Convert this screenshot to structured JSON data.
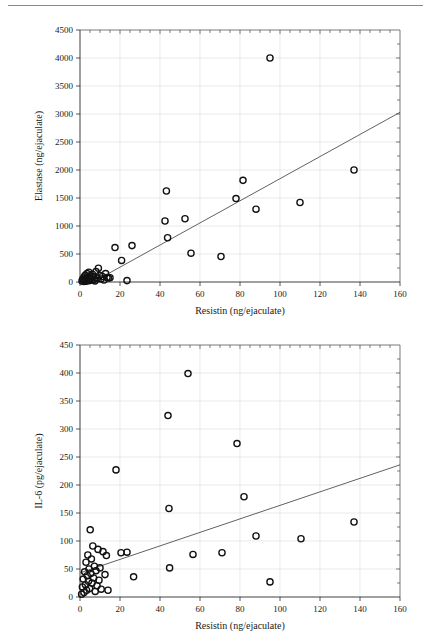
{
  "figure": {
    "has_top_rule": true,
    "background_color": "#ffffff",
    "marker_color": "#111111",
    "line_color": "#444444",
    "grid_color": "#dcdcdc"
  },
  "chart_data": [
    {
      "id": "elastase-vs-resistin",
      "type": "scatter",
      "title": "",
      "xlabel": "Resistin (ng/ejaculate)",
      "ylabel": "Elastase (ng/ejaculate)",
      "xlim": [
        0,
        160
      ],
      "ylim": [
        0,
        4500
      ],
      "xticks": [
        0,
        20,
        40,
        60,
        80,
        100,
        120,
        140,
        160
      ],
      "yticks": [
        0,
        500,
        1000,
        1500,
        2000,
        2500,
        3000,
        3500,
        4000,
        4500
      ],
      "xticklabels": [
        "0",
        "20",
        "40",
        "60",
        "80",
        "100",
        "120",
        "140",
        "160"
      ],
      "yticklabels": [
        "0",
        "500",
        "1000",
        "1500",
        "2000",
        "2500",
        "3000",
        "3500",
        "4000",
        "4500"
      ],
      "grid": true,
      "legend": null,
      "marker": "open-circle",
      "points": [
        [
          1.0,
          20
        ],
        [
          1.4,
          55
        ],
        [
          1.8,
          10
        ],
        [
          2.0,
          90
        ],
        [
          2.3,
          35
        ],
        [
          2.6,
          120
        ],
        [
          2.9,
          60
        ],
        [
          3.2,
          15
        ],
        [
          3.5,
          150
        ],
        [
          3.8,
          80
        ],
        [
          4.1,
          40
        ],
        [
          4.4,
          175
        ],
        [
          4.7,
          25
        ],
        [
          5.0,
          110
        ],
        [
          5.4,
          65
        ],
        [
          5.8,
          30
        ],
        [
          6.2,
          140
        ],
        [
          6.6,
          95
        ],
        [
          7.0,
          45
        ],
        [
          7.5,
          20
        ],
        [
          8.0,
          185
        ],
        [
          8.6,
          70
        ],
        [
          9.2,
          245
        ],
        [
          9.8,
          120
        ],
        [
          10.5,
          55
        ],
        [
          11.2,
          100
        ],
        [
          12.0,
          35
        ],
        [
          12.8,
          150
        ],
        [
          13.5,
          80
        ],
        [
          14.2,
          70
        ],
        [
          15.0,
          75
        ],
        [
          17.5,
          615
        ],
        [
          20.8,
          385
        ],
        [
          23.5,
          25
        ],
        [
          26.0,
          650
        ],
        [
          42.5,
          1090
        ],
        [
          43.2,
          1625
        ],
        [
          43.8,
          790
        ],
        [
          52.5,
          1130
        ],
        [
          55.5,
          515
        ],
        [
          70.5,
          455
        ],
        [
          78.0,
          1490
        ],
        [
          81.5,
          1815
        ],
        [
          88.0,
          1300
        ],
        [
          95.0,
          4000
        ],
        [
          110.0,
          1420
        ],
        [
          137.0,
          2000
        ]
      ],
      "fit_line": {
        "x": [
          0,
          160
        ],
        "y": [
          -130,
          3030
        ]
      }
    },
    {
      "id": "il6-vs-resistin",
      "type": "scatter",
      "title": "",
      "xlabel": "Resistin (ng/ejaculate)",
      "ylabel": "IL-6 (pg/ejaculate)",
      "xlim": [
        0,
        160
      ],
      "ylim": [
        0,
        450
      ],
      "xticks": [
        0,
        20,
        40,
        60,
        80,
        100,
        120,
        140,
        160
      ],
      "yticks": [
        0,
        50,
        100,
        150,
        200,
        250,
        300,
        350,
        400,
        450
      ],
      "xticklabels": [
        "0",
        "20",
        "40",
        "60",
        "80",
        "100",
        "120",
        "140",
        "160"
      ],
      "yticklabels": [
        "0",
        "50",
        "100",
        "150",
        "200",
        "250",
        "300",
        "350",
        "400",
        "450"
      ],
      "grid": true,
      "legend": null,
      "marker": "open-circle",
      "points": [
        [
          0.8,
          5
        ],
        [
          1.2,
          18
        ],
        [
          1.6,
          32
        ],
        [
          2.0,
          8
        ],
        [
          2.3,
          45
        ],
        [
          2.7,
          22
        ],
        [
          3.0,
          62
        ],
        [
          3.3,
          12
        ],
        [
          3.6,
          38
        ],
        [
          3.9,
          75
        ],
        [
          4.2,
          28
        ],
        [
          4.5,
          50
        ],
        [
          4.8,
          15
        ],
        [
          5.1,
          120
        ],
        [
          5.4,
          42
        ],
        [
          5.7,
          68
        ],
        [
          6.0,
          25
        ],
        [
          6.4,
          91
        ],
        [
          6.8,
          34
        ],
        [
          7.2,
          55
        ],
        [
          7.6,
          10
        ],
        [
          8.0,
          47
        ],
        [
          8.5,
          20
        ],
        [
          9.0,
          85
        ],
        [
          9.5,
          30
        ],
        [
          10.0,
          52
        ],
        [
          10.6,
          14
        ],
        [
          11.5,
          81
        ],
        [
          12.5,
          40
        ],
        [
          13.2,
          74
        ],
        [
          14.0,
          12
        ],
        [
          18.0,
          227
        ],
        [
          20.5,
          79
        ],
        [
          23.5,
          80
        ],
        [
          26.8,
          36
        ],
        [
          44.0,
          324
        ],
        [
          44.5,
          158
        ],
        [
          44.8,
          52
        ],
        [
          54.0,
          399
        ],
        [
          56.5,
          76
        ],
        [
          71.0,
          79
        ],
        [
          78.5,
          274
        ],
        [
          82.0,
          179
        ],
        [
          88.0,
          109
        ],
        [
          95.0,
          27
        ],
        [
          110.5,
          104
        ],
        [
          137.0,
          134
        ]
      ],
      "fit_line": {
        "x": [
          0,
          160
        ],
        "y": [
          43,
          236
        ]
      }
    }
  ]
}
